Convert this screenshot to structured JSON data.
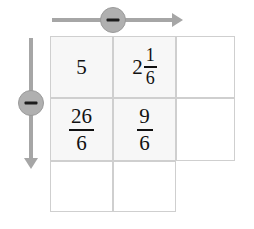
{
  "canvas": {
    "width": 254,
    "height": 229,
    "background": "#ffffff"
  },
  "colors": {
    "arrow": "#a6a6a6",
    "badge_fill": "#b0b0b0",
    "badge_border": "#9a9a9a",
    "badge_glyph": "#1d1d1d",
    "grid_line": "#cfcfcf",
    "cell_shaded": "#f7f7f7",
    "text": "#111111"
  },
  "controls": {
    "horizontal": {
      "label": "−",
      "icon": "minus-icon",
      "direction": "right",
      "description": "horizontal-arrow"
    },
    "vertical": {
      "label": "−",
      "icon": "minus-icon",
      "direction": "down",
      "description": "vertical-arrow"
    }
  },
  "grid": {
    "rows": 3,
    "columns": 3,
    "cells": [
      [
        {
          "kind": "whole",
          "whole": "5",
          "numerator": "",
          "denominator": "",
          "shaded": true,
          "visible": true
        },
        {
          "kind": "mixed",
          "whole": "2",
          "numerator": "1",
          "denominator": "6",
          "shaded": true,
          "visible": true
        },
        {
          "kind": "empty",
          "whole": "",
          "numerator": "",
          "denominator": "",
          "shaded": false,
          "visible": true
        }
      ],
      [
        {
          "kind": "frac",
          "whole": "",
          "numerator": "26",
          "denominator": "6",
          "shaded": true,
          "visible": true
        },
        {
          "kind": "frac",
          "whole": "",
          "numerator": "9",
          "denominator": "6",
          "shaded": true,
          "visible": true
        },
        {
          "kind": "empty",
          "whole": "",
          "numerator": "",
          "denominator": "",
          "shaded": false,
          "visible": true
        }
      ],
      [
        {
          "kind": "empty",
          "whole": "",
          "numerator": "",
          "denominator": "",
          "shaded": false,
          "visible": true
        },
        {
          "kind": "empty",
          "whole": "",
          "numerator": "",
          "denominator": "",
          "shaded": false,
          "visible": true
        },
        {
          "kind": "empty",
          "whole": "",
          "numerator": "",
          "denominator": "",
          "shaded": false,
          "visible": false
        }
      ]
    ]
  }
}
